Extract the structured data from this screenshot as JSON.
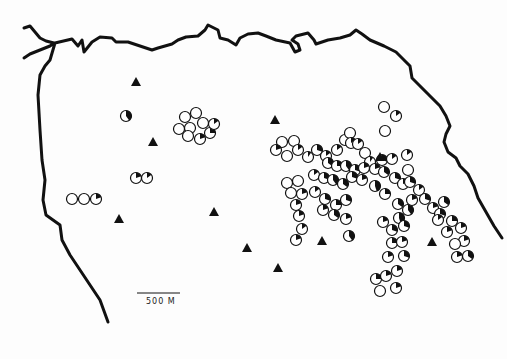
{
  "map": {
    "scale_bar": {
      "label": "500 M",
      "x1": 137,
      "x2": 180,
      "y": 297
    },
    "colors": {
      "coast": "#111111",
      "symbol": "#111111",
      "background": "#fdfdfd"
    },
    "legend_symbols": {
      "circle": "site (open circle, filled wedge indicates proportion)",
      "triangle": "triangle marker"
    },
    "triangles": [
      [
        136,
        82
      ],
      [
        153,
        142
      ],
      [
        119,
        219
      ],
      [
        214,
        212
      ],
      [
        247,
        248
      ],
      [
        275,
        120
      ],
      [
        278,
        268
      ],
      [
        322,
        241
      ],
      [
        380,
        157
      ],
      [
        432,
        242
      ]
    ],
    "circles": [
      [
        126,
        116,
        0.4
      ],
      [
        72,
        199,
        0
      ],
      [
        84,
        199,
        0
      ],
      [
        96,
        199,
        0.2
      ],
      [
        136,
        178,
        0.2
      ],
      [
        147,
        178,
        0.15
      ],
      [
        185,
        117,
        0
      ],
      [
        196,
        113,
        0
      ],
      [
        203,
        123,
        0
      ],
      [
        190,
        128,
        0
      ],
      [
        179,
        129,
        0
      ],
      [
        188,
        136,
        0
      ],
      [
        200,
        139,
        0.2
      ],
      [
        210,
        133,
        0.25
      ],
      [
        214,
        124,
        0.15
      ],
      [
        384,
        107,
        0
      ],
      [
        396,
        116,
        0.15
      ],
      [
        385,
        131,
        0
      ],
      [
        282,
        142,
        0
      ],
      [
        294,
        141,
        0
      ],
      [
        276,
        150,
        0.2
      ],
      [
        287,
        156,
        0
      ],
      [
        298,
        150,
        0.15
      ],
      [
        308,
        157,
        0.1
      ],
      [
        317,
        150,
        0.3
      ],
      [
        326,
        156,
        0.15
      ],
      [
        337,
        150,
        0.15
      ],
      [
        345,
        140,
        0
      ],
      [
        350,
        133,
        0
      ],
      [
        351,
        143,
        0.15
      ],
      [
        358,
        144,
        0.15
      ],
      [
        365,
        153,
        0
      ],
      [
        370,
        162,
        0.1
      ],
      [
        382,
        160,
        0.3
      ],
      [
        392,
        159,
        0.15
      ],
      [
        407,
        155,
        0.15
      ],
      [
        328,
        163,
        0.35
      ],
      [
        337,
        166,
        0.25
      ],
      [
        346,
        166,
        0.4
      ],
      [
        355,
        170,
        0.3
      ],
      [
        364,
        168,
        0.2
      ],
      [
        375,
        169,
        0.2
      ],
      [
        384,
        172,
        0.35
      ],
      [
        395,
        178,
        0.3
      ],
      [
        403,
        184,
        0.2
      ],
      [
        314,
        175,
        0.15
      ],
      [
        324,
        178,
        0.3
      ],
      [
        333,
        180,
        0.4
      ],
      [
        343,
        184,
        0.35
      ],
      [
        352,
        177,
        0.3
      ],
      [
        362,
        180,
        0.2
      ],
      [
        287,
        183,
        0
      ],
      [
        298,
        181,
        0
      ],
      [
        291,
        193,
        0
      ],
      [
        302,
        194,
        0.2
      ],
      [
        296,
        205,
        0.2
      ],
      [
        299,
        216,
        0.2
      ],
      [
        302,
        229,
        0.15
      ],
      [
        296,
        240,
        0.2
      ],
      [
        315,
        192,
        0.15
      ],
      [
        325,
        199,
        0.3
      ],
      [
        336,
        205,
        0.25
      ],
      [
        346,
        200,
        0.3
      ],
      [
        334,
        215,
        0.35
      ],
      [
        346,
        219,
        0.2
      ],
      [
        323,
        210,
        0.2
      ],
      [
        349,
        236,
        0.4
      ],
      [
        375,
        186,
        0.45
      ],
      [
        385,
        194,
        0.25
      ],
      [
        398,
        204,
        0.35
      ],
      [
        408,
        210,
        0.4
      ],
      [
        399,
        218,
        0.45
      ],
      [
        392,
        230,
        0.3
      ],
      [
        383,
        222,
        0.2
      ],
      [
        404,
        226,
        0.3
      ],
      [
        412,
        200,
        0.2
      ],
      [
        419,
        190,
        0.15
      ],
      [
        410,
        182,
        0.3
      ],
      [
        408,
        170,
        0
      ],
      [
        425,
        199,
        0.3
      ],
      [
        433,
        208,
        0.2
      ],
      [
        440,
        214,
        0.3
      ],
      [
        444,
        202,
        0.35
      ],
      [
        452,
        221,
        0.25
      ],
      [
        461,
        228,
        0.2
      ],
      [
        464,
        241,
        0.2
      ],
      [
        468,
        256,
        0.35
      ],
      [
        457,
        257,
        0.2
      ],
      [
        455,
        244,
        0
      ],
      [
        438,
        220,
        0.15
      ],
      [
        447,
        232,
        0.2
      ],
      [
        392,
        243,
        0.25
      ],
      [
        402,
        242,
        0.2
      ],
      [
        404,
        256,
        0.3
      ],
      [
        388,
        257,
        0.2
      ],
      [
        376,
        279,
        0.25
      ],
      [
        386,
        276,
        0.2
      ],
      [
        397,
        271,
        0.2
      ],
      [
        380,
        291,
        0
      ],
      [
        396,
        288,
        0.2
      ]
    ]
  }
}
